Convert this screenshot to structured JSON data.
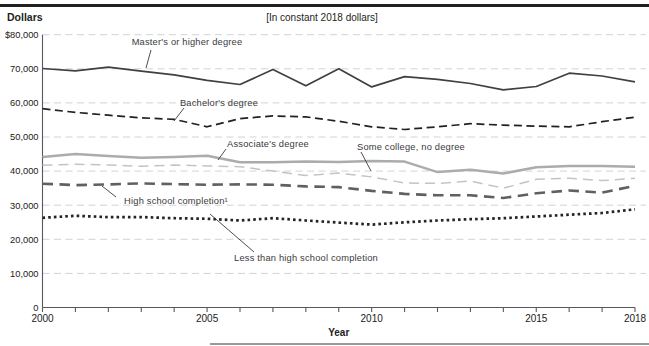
{
  "header": {
    "y_axis_unit_label": "Dollars",
    "note": "[In constant 2018 dollars]"
  },
  "chart_data": {
    "type": "line",
    "title": "",
    "note": "[In constant 2018 dollars]",
    "xlabel": "Year",
    "ylabel": "Dollars",
    "ylim": [
      0,
      80000
    ],
    "grid": "horizontal-dashed",
    "grid_color": "#d2d3d5",
    "axis_color": "#59595b",
    "x": [
      2000,
      2001,
      2002,
      2003,
      2004,
      2005,
      2006,
      2007,
      2008,
      2009,
      2010,
      2011,
      2012,
      2013,
      2014,
      2015,
      2016,
      2017,
      2018
    ],
    "x_tick_labels": [
      {
        "year": 2000,
        "label": "2000"
      },
      {
        "year": 2005,
        "label": "2005"
      },
      {
        "year": 2010,
        "label": "2010"
      },
      {
        "year": 2015,
        "label": "2015"
      },
      {
        "year": 2018,
        "label": "2018"
      }
    ],
    "y_ticks": [
      {
        "value": 80000,
        "label": "$80,000"
      },
      {
        "value": 70000,
        "label": "70,000"
      },
      {
        "value": 60000,
        "label": "60,000"
      },
      {
        "value": 50000,
        "label": "50,000"
      },
      {
        "value": 40000,
        "label": "40,000"
      },
      {
        "value": 30000,
        "label": "30,000"
      },
      {
        "value": 20000,
        "label": "20,000"
      },
      {
        "value": 10000,
        "label": "10,000"
      },
      {
        "value": 0,
        "label": "0"
      }
    ],
    "series": [
      {
        "id": "masters",
        "name": "Master's or higher degree",
        "style": "solid",
        "color": "#3f4042",
        "width": 1.7,
        "dash": null,
        "values": [
          70100,
          69400,
          70500,
          69300,
          68200,
          66600,
          65400,
          69800,
          65000,
          70000,
          64700,
          67700,
          66900,
          65700,
          63800,
          64800,
          68700,
          67900,
          66200
        ]
      },
      {
        "id": "bachelors",
        "name": "Bachelor's degree",
        "style": "dashed",
        "color": "#232021",
        "width": 1.7,
        "dash": [
          8,
          4.5
        ],
        "values": [
          58300,
          57200,
          56400,
          55600,
          55200,
          53000,
          55400,
          56200,
          55900,
          54600,
          53000,
          52200,
          53000,
          53900,
          53500,
          53200,
          53000,
          54500,
          55800
        ]
      },
      {
        "id": "associates",
        "name": "Associate's degree",
        "style": "solid",
        "color": "#aaacae",
        "width": 2.5,
        "dash": null,
        "values": [
          44100,
          45000,
          44400,
          43900,
          44100,
          44500,
          42600,
          42600,
          42800,
          42700,
          43000,
          42800,
          39700,
          40400,
          39300,
          41100,
          41500,
          41500,
          41300
        ]
      },
      {
        "id": "some-college",
        "name": "Some college, no degree",
        "style": "dashed",
        "color": "#c3c4c6",
        "width": 1.5,
        "dash": [
          10,
          6
        ],
        "values": [
          41700,
          42000,
          41800,
          41400,
          41800,
          41500,
          41300,
          40000,
          38700,
          39400,
          38300,
          36500,
          36400,
          37100,
          35000,
          37600,
          37900,
          37200,
          37900
        ]
      },
      {
        "id": "high-school",
        "name": "High school completion¹",
        "style": "dashed",
        "color": "#5f6062",
        "width": 2.6,
        "dash": [
          10.5,
          6.5
        ],
        "values": [
          36300,
          35900,
          36100,
          36400,
          36200,
          36000,
          36100,
          36000,
          35500,
          35300,
          34200,
          33300,
          32900,
          32900,
          32100,
          33500,
          34300,
          33700,
          35700
        ]
      },
      {
        "id": "less-than-hs",
        "name": "Less than high school completion",
        "style": "dotted",
        "color": "#262324",
        "width": 2.7,
        "dash": [
          2.6,
          3.1
        ],
        "values": [
          26300,
          26900,
          26500,
          26500,
          26200,
          26000,
          25500,
          26200,
          25500,
          24900,
          24300,
          25000,
          25500,
          25900,
          26200,
          26700,
          27200,
          27700,
          28800
        ]
      }
    ],
    "annotations": [
      {
        "series": "masters",
        "text": "Master's or higher degree",
        "tx": 187,
        "ty": 45,
        "lx1": 151,
        "ly1": 50,
        "lx2": 146,
        "ly2": 68
      },
      {
        "series": "bachelors",
        "text": "Bachelor's degree",
        "tx": 219,
        "ty": 106,
        "lx1": 184,
        "ly1": 108,
        "lx2": 174,
        "ly2": 121
      },
      {
        "series": "associates",
        "text": "Associate's degree",
        "tx": 268,
        "ty": 147,
        "lx1": 226,
        "ly1": 149,
        "lx2": 218,
        "ly2": 160
      },
      {
        "series": "some-college",
        "text": "Some college, no degree",
        "tx": 411,
        "ty": 150,
        "lx1": 361,
        "ly1": 152,
        "lx2": 371,
        "ly2": 171
      },
      {
        "series": "high-school",
        "text": "High school completion¹",
        "tx": 176,
        "ty": 204,
        "lx1": 116,
        "ly1": 197,
        "lx2": 102,
        "ly2": 186
      },
      {
        "series": "less-than-hs",
        "text": "Less than high school completion",
        "tx": 306,
        "ty": 261,
        "lx1": 254,
        "ly1": 252,
        "lx2": 210,
        "ly2": 214
      }
    ]
  }
}
